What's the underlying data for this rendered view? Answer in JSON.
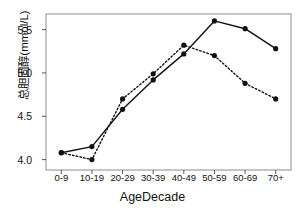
{
  "chart_data": {
    "type": "line",
    "title": "",
    "xlabel": "AgeDecade",
    "ylabel": "总胆固醇(mmol/L)",
    "categories": [
      "0-9",
      "10-19",
      "20-29",
      "30-39",
      "40-49",
      "50-59",
      "60-69",
      "70+"
    ],
    "ylim": [
      3.88,
      5.68
    ],
    "yticks": [
      4.0,
      4.5,
      5.0,
      5.5
    ],
    "ytick_labels": [
      "4.0",
      "4.5",
      "5.0",
      "5.5"
    ],
    "grid": false,
    "legend": "none",
    "series": [
      {
        "name": "solid",
        "style": "solid",
        "marker": "filled-circle",
        "color": "#111111",
        "values": [
          4.08,
          4.15,
          4.58,
          4.92,
          5.22,
          5.6,
          5.51,
          5.28
        ]
      },
      {
        "name": "dashed",
        "style": "dashed",
        "marker": "filled-circle",
        "color": "#111111",
        "values": [
          4.08,
          4.0,
          4.7,
          4.99,
          5.32,
          5.2,
          4.88,
          4.7
        ]
      }
    ]
  },
  "axes": {
    "y_axis_title": "总胆固醇(mmol/L)",
    "x_axis_title": "AgeDecade"
  }
}
